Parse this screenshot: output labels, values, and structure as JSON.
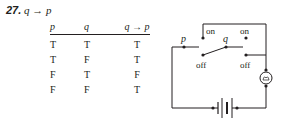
{
  "problem": {
    "number": "27.",
    "expression": "q → p"
  },
  "truth_table": {
    "headers": [
      "p",
      "q",
      "q → p"
    ],
    "rows": [
      [
        "T",
        "T",
        "T"
      ],
      [
        "T",
        "F",
        "T"
      ],
      [
        "F",
        "T",
        "F"
      ],
      [
        "F",
        "F",
        "T"
      ]
    ]
  },
  "circuit": {
    "switch_p_label": "p",
    "switch_q_label": "q",
    "on_label_1": "on",
    "on_label_2": "on",
    "off_label_1": "off",
    "off_label_2": "off",
    "bulb_icon": "light-bulb-icon",
    "battery_icon": "battery-icon",
    "line_color": "#231f20"
  }
}
